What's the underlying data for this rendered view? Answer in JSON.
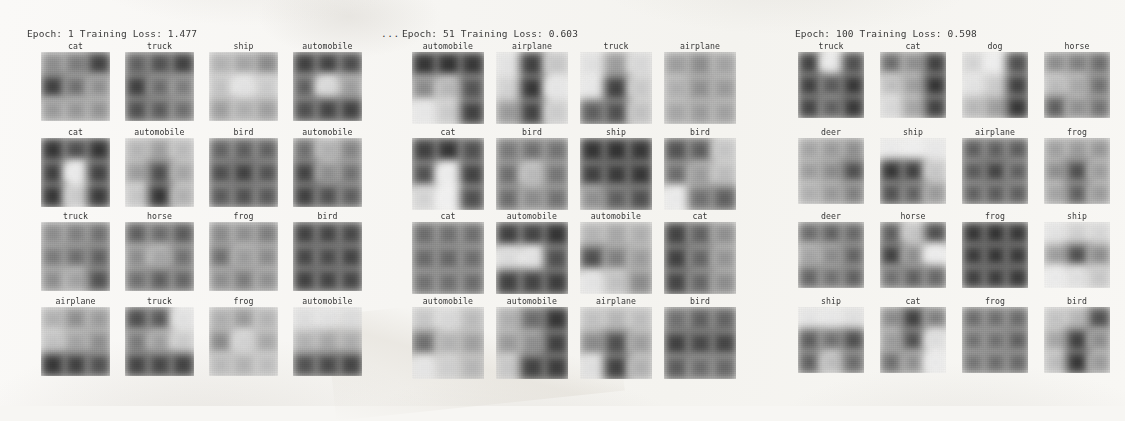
{
  "figure": {
    "background_color": "#f7f6f3",
    "ellipsis_between_panels": "..."
  },
  "panels": [
    {
      "title": "Epoch: 1 Training Loss: 1.477",
      "epoch": 1,
      "training_loss": 1.477,
      "left": 27,
      "grid_left": 41,
      "tile_size": 69,
      "col_pitch": 84,
      "labels": [
        [
          "cat",
          "truck",
          "ship",
          "automobile"
        ],
        [
          "cat",
          "automobile",
          "bird",
          "automobile"
        ],
        [
          "truck",
          "horse",
          "frog",
          "bird"
        ],
        [
          "airplane",
          "truck",
          "frog",
          "automobile"
        ]
      ],
      "tones": [
        [
          [
            "#8d8d8d",
            "#7b7b7b",
            "#3c3c3c",
            "#3a3a3a",
            "#6e6e6e",
            "#8f8f8f",
            "#9a9a9a",
            "#979797",
            "#949494"
          ],
          [
            "#5e5e5e",
            "#4d4d4d",
            "#3b3b3b",
            "#3a3a3a",
            "#6a6a6a",
            "#7c7c7c",
            "#4b4b4b",
            "#575757",
            "#6d6d6d"
          ],
          [
            "#b4b4b4",
            "#a6a6a6",
            "#8a8a8a",
            "#c6c6c6",
            "#e8e8e8",
            "#cfcfcf",
            "#9f9f9f",
            "#b0b0b0",
            "#a0a0a0"
          ],
          [
            "#3a3a3a",
            "#3d3d3d",
            "#474747",
            "#5d5d5d",
            "#dedede",
            "#9e9e9e",
            "#4a4a4a",
            "#3f3f3f",
            "#3b3b3b"
          ]
        ],
        [
          [
            "#2e2e2e",
            "#4a4a4a",
            "#2d2d2d",
            "#3a3a3a",
            "#f0f0f0",
            "#3d3d3d",
            "#2f2f2f",
            "#cfcfcf",
            "#343434"
          ],
          [
            "#b8b8b8",
            "#9f9f9f",
            "#bdbdbd",
            "#9d9d9d",
            "#4a4a4a",
            "#a6a6a6",
            "#c9c9c9",
            "#2e2e2e",
            "#b2b2b2"
          ],
          [
            "#616161",
            "#5a5a5a",
            "#5e5e5e",
            "#4a4a4a",
            "#3b3b3b",
            "#4e4e4e",
            "#565656",
            "#4c4c4c",
            "#545454"
          ],
          [
            "#6e6e6e",
            "#b2b2b2",
            "#848484",
            "#3d3d3d",
            "#8e8e8e",
            "#707070",
            "#3a3a3a",
            "#4c4c4c",
            "#5a5a5a"
          ]
        ],
        [
          [
            "#8c8c8c",
            "#7f7f7f",
            "#6f6f6f",
            "#7a7a7a",
            "#6c6c6c",
            "#5e5e5e",
            "#8e8e8e",
            "#a2a2a2",
            "#4d4d4d"
          ],
          [
            "#5d5d5d",
            "#6a6a6a",
            "#575757",
            "#8d8d8d",
            "#a7a7a7",
            "#707070",
            "#6f6f6f",
            "#5c5c5c",
            "#636363"
          ],
          [
            "#8a8a8a",
            "#8f8f8f",
            "#7d7d7d",
            "#6e6e6e",
            "#9c9c9c",
            "#8b8b8b",
            "#8e8e8e",
            "#7b7b7b",
            "#909090"
          ],
          [
            "#3c3c3c",
            "#3f3f3f",
            "#424242",
            "#414141",
            "#454545",
            "#3d3d3d",
            "#3b3b3b",
            "#3e3e3e",
            "#404040"
          ]
        ],
        [
          [
            "#b3b3b3",
            "#8f8f8f",
            "#9c9c9c",
            "#c5c5c5",
            "#a4a4a4",
            "#8e8e8e",
            "#2f2f2f",
            "#3a3a3a",
            "#4c4c4c"
          ],
          [
            "#4a4a4a",
            "#555555",
            "#e6e6e6",
            "#7a7a7a",
            "#9f9f9f",
            "#cfcfcf",
            "#3f3f3f",
            "#414141",
            "#3c3c3c"
          ],
          [
            "#b0b0b0",
            "#9b9b9b",
            "#b6b6b6",
            "#8a8a8a",
            "#d6d6d6",
            "#a9a9a9",
            "#bcbcbc",
            "#b4b4b4",
            "#c0c0c0"
          ],
          [
            "#e2e2e2",
            "#e6e6e6",
            "#e0e0e0",
            "#b4b4b4",
            "#a8a8a8",
            "#aeaeae",
            "#4d4d4d",
            "#444444",
            "#3e3e3e"
          ]
        ]
      ]
    },
    {
      "title": "Epoch: 51 Training Loss: 0.603",
      "epoch": 51,
      "training_loss": 0.603,
      "left": 402,
      "grid_left": 412,
      "tile_size": 72,
      "col_pitch": 84,
      "labels": [
        [
          "automobile",
          "airplane",
          "truck",
          "airplane"
        ],
        [
          "cat",
          "bird",
          "ship",
          "bird"
        ],
        [
          "cat",
          "automobile",
          "automobile",
          "cat"
        ],
        [
          "automobile",
          "automobile",
          "airplane",
          "bird"
        ]
      ],
      "tones": [
        [
          [
            "#2e2e2e",
            "#2b2b2b",
            "#303030",
            "#8a8a8a",
            "#b9b9b9",
            "#4f4f4f",
            "#ececec",
            "#cfcfcf",
            "#3a3a3a"
          ],
          [
            "#e8e8e8",
            "#3a3a3a",
            "#cacaca",
            "#d6d6d6",
            "#2f2f2f",
            "#ebebeb",
            "#9a9a9a",
            "#3c3c3c",
            "#d0d0d0"
          ],
          [
            "#e6e6e6",
            "#9d9d9d",
            "#dcdcdc",
            "#ededed",
            "#3b3b3b",
            "#cdcdcd",
            "#5b5b5b",
            "#4a4a4a",
            "#c4c4c4"
          ],
          [
            "#9e9e9e",
            "#8c8c8c",
            "#a3a3a3",
            "#b0b0b0",
            "#8f8f8f",
            "#9a9a9a",
            "#a7a7a7",
            "#9b9b9b",
            "#a1a1a1"
          ]
        ],
        [
          [
            "#3a3a3a",
            "#2e2e2e",
            "#4b4b4b",
            "#4d4d4d",
            "#f2f2f2",
            "#3c3c3c",
            "#d8d8d8",
            "#f6f6f6",
            "#4a4a4a"
          ],
          [
            "#787878",
            "#6e6e6e",
            "#717171",
            "#6c6c6c",
            "#bcbcbc",
            "#747474",
            "#6a6a6a",
            "#8b8b8b",
            "#707070"
          ],
          [
            "#2d2d2d",
            "#2a2a2a",
            "#2f2f2f",
            "#3a3a3a",
            "#323232",
            "#2e2e2e",
            "#8f8f8f",
            "#5b5b5b",
            "#4a4a4a"
          ],
          [
            "#4e4e4e",
            "#5a5a5a",
            "#c8c8c8",
            "#6a6a6a",
            "#9c9c9c",
            "#bfbfbf",
            "#f0f0f0",
            "#6e6e6e",
            "#5c5c5c"
          ]
        ],
        [
          [
            "#6a6a6a",
            "#6e6e6e",
            "#6c6c6c",
            "#676767",
            "#646464",
            "#6b6b6b",
            "#707070",
            "#6d6d6d",
            "#696969"
          ],
          [
            "#3a3a3a",
            "#3e3e3e",
            "#2c2c2c",
            "#e0e0e0",
            "#e8e8e8",
            "#4a4a4a",
            "#3b3b3b",
            "#3d3d3d",
            "#353535"
          ],
          [
            "#b6b6b6",
            "#a8a8a8",
            "#b0b0b0",
            "#4a4a4a",
            "#7e7e7e",
            "#9c9c9c",
            "#e9e9e9",
            "#c4c4c4",
            "#8a8a8a"
          ],
          [
            "#3c3c3c",
            "#5e5e5e",
            "#8f8f8f",
            "#3a3a3a",
            "#626262",
            "#949494",
            "#3e3e3e",
            "#636363",
            "#8c8c8c"
          ]
        ],
        [
          [
            "#cbcbcb",
            "#dcdcdc",
            "#bebebe",
            "#6e6e6e",
            "#b4b4b4",
            "#a0a0a0",
            "#eaeaea",
            "#d2d2d2",
            "#b8b8b8"
          ],
          [
            "#b0b0b0",
            "#6a6a6a",
            "#2e2e2e",
            "#9a9a9a",
            "#8e8e8e",
            "#3a3a3a",
            "#cacaca",
            "#3c3c3c",
            "#353535"
          ],
          [
            "#c4c4c4",
            "#b8b8b8",
            "#c0c0c0",
            "#8a8a8a",
            "#4a4a4a",
            "#9e9e9e",
            "#e4e4e4",
            "#3b3b3b",
            "#b2b2b2"
          ],
          [
            "#6e6e6e",
            "#5c5c5c",
            "#606060",
            "#3a3a3a",
            "#424242",
            "#3e3e3e",
            "#585858",
            "#6a6a6a",
            "#656565"
          ]
        ]
      ]
    },
    {
      "title": "Epoch: 100 Training Loss: 0.598",
      "epoch": 100,
      "training_loss": 0.598,
      "left": 795,
      "grid_left": 798,
      "tile_size": 66,
      "col_pitch": 82,
      "labels": [
        [
          "truck",
          "cat",
          "dog",
          "horse"
        ],
        [
          "deer",
          "ship",
          "airplane",
          "frog"
        ],
        [
          "deer",
          "horse",
          "frog",
          "ship"
        ],
        [
          "ship",
          "cat",
          "frog",
          "bird"
        ]
      ],
      "tones": [
        [
          [
            "#3c3c3c",
            "#f0f0f0",
            "#4a4a4a",
            "#3a3a3a",
            "#555555",
            "#2f2f2f",
            "#3e3e3e",
            "#5c5c5c",
            "#303030"
          ],
          [
            "#6a6a6a",
            "#8e8e8e",
            "#3a3a3a",
            "#c2c2c2",
            "#9e9e9e",
            "#2c2c2c",
            "#dcdcdc",
            "#a6a6a6",
            "#3b3b3b"
          ],
          [
            "#d8d8d8",
            "#f4f4f4",
            "#4a4a4a",
            "#e8e8e8",
            "#cfcfcf",
            "#3a3a3a",
            "#bababa",
            "#9e9e9e",
            "#2e2e2e"
          ],
          [
            "#8c8c8c",
            "#7e7e7e",
            "#6a6a6a",
            "#bebebe",
            "#a8a8a8",
            "#6e6e6e",
            "#5a5a5a",
            "#8f8f8f",
            "#707070"
          ]
        ],
        [
          [
            "#a4a4a4",
            "#9a9a9a",
            "#8e8e8e",
            "#9c9c9c",
            "#8a8a8a",
            "#4a4a4a",
            "#b0b0b0",
            "#989898",
            "#7e7e7e"
          ],
          [
            "#efefef",
            "#f4f4f4",
            "#ededed",
            "#2f2f2f",
            "#3a3a3a",
            "#cacaca",
            "#4c4c4c",
            "#5e5e5e",
            "#9a9a9a"
          ],
          [
            "#5a5a5a",
            "#5c5c5c",
            "#585858",
            "#555555",
            "#3d3d3d",
            "#5b5b5b",
            "#5e5e5e",
            "#565656",
            "#5a5a5a"
          ],
          [
            "#a0a0a0",
            "#9a9a9a",
            "#969696",
            "#8e8e8e",
            "#4a4a4a",
            "#9c9c9c",
            "#a4a4a4",
            "#5c5c5c",
            "#9a9a9a"
          ]
        ],
        [
          [
            "#6a6a6a",
            "#5e5e5e",
            "#656565",
            "#a4a4a4",
            "#8a8a8a",
            "#606060",
            "#626262",
            "#6e6e6e",
            "#5c5c5c"
          ],
          [
            "#5a5a5a",
            "#c8c8c8",
            "#4a4a4a",
            "#3a3a3a",
            "#8e8e8e",
            "#f2f2f2",
            "#6e6e6e",
            "#5c5c5c",
            "#646464"
          ],
          [
            "#2f2f2f",
            "#2b2b2b",
            "#303030",
            "#343434",
            "#2e2e2e",
            "#323232",
            "#3a3a3a",
            "#363636",
            "#313131"
          ],
          [
            "#e8e8e8",
            "#d4d4d4",
            "#dadada",
            "#9e9e9e",
            "#4a4a4a",
            "#8c8c8c",
            "#f0f0f0",
            "#e4e4e4",
            "#cacaca"
          ]
        ],
        [
          [
            "#e9e9e9",
            "#ececec",
            "#e4e4e4",
            "#5a5a5a",
            "#6e6e6e",
            "#4a4a4a",
            "#5e5e5e",
            "#c0c0c0",
            "#6a6a6a"
          ],
          [
            "#8a8a8a",
            "#3a3a3a",
            "#7e7e7e",
            "#9c9c9c",
            "#4c4c4c",
            "#e2e2e2",
            "#6e6e6e",
            "#8f8f8f",
            "#f0f0f0"
          ],
          [
            "#6a6a6a",
            "#6c6c6c",
            "#686868",
            "#707070",
            "#6e6e6e",
            "#5c5c5c",
            "#747474",
            "#6a6a6a",
            "#666666"
          ],
          [
            "#c6c6c6",
            "#b8b8b8",
            "#4a4a4a",
            "#a6a6a6",
            "#3a3a3a",
            "#8c8c8c",
            "#bfbfbf",
            "#2e2e2e",
            "#9a9a9a"
          ]
        ]
      ]
    }
  ],
  "layout": {
    "title_top": 28,
    "row_tops": [
      52,
      138,
      222,
      307
    ],
    "label_offset": -11
  }
}
